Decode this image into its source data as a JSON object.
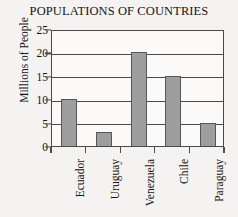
{
  "chart_data": {
    "type": "bar",
    "title": "POPULATIONS OF COUNTRIES",
    "xlabel": "",
    "ylabel": "Millions of People",
    "categories": [
      "Ecuador",
      "Uruguay",
      "Venezuela",
      "Chile",
      "Paraguay"
    ],
    "values": [
      10,
      3,
      20,
      15,
      5
    ],
    "ylim": [
      0,
      25
    ],
    "ytick_labels": [
      "0",
      "5",
      "10",
      "15",
      "20",
      "25"
    ],
    "ytick_values": [
      0,
      5,
      10,
      15,
      20,
      25
    ],
    "grid": true,
    "legend": "none",
    "bar_color": "#9e9e9e",
    "bar_border_color": "#575757",
    "axis_color": "#4a4a4a",
    "background_color": "#f4f3f1",
    "plot_background_color": "#fbfaf8"
  }
}
